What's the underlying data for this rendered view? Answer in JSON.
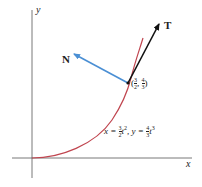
{
  "diagram": {
    "axes": {
      "x_label": "x",
      "y_label": "y"
    },
    "curve": {
      "color": "#c0454f",
      "equation": {
        "x_part": "x = ",
        "x_num": "3",
        "x_den": "2",
        "x_var": "t",
        "x_exp": "2",
        "sep": ", y = ",
        "y_num": "4",
        "y_den": "3",
        "y_var": "t",
        "y_exp": "3"
      }
    },
    "point": {
      "x_num": "3",
      "x_den": "2",
      "y_num": "4",
      "y_den": "3"
    },
    "vectors": {
      "tangent": {
        "label": "T",
        "color": "#111111"
      },
      "normal": {
        "label": "N",
        "color": "#4a8fd4"
      }
    }
  }
}
